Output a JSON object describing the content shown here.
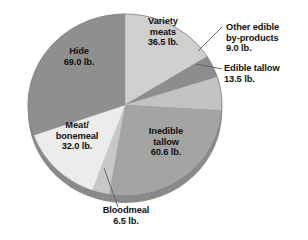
{
  "chart_data": {
    "type": "pie",
    "title": "",
    "subtitle": "",
    "unit": "lb.",
    "total": 227.1,
    "categories": [
      "Variety meats",
      "Other edible by-products",
      "Edible tallow",
      "Inedible tallow",
      "Bloodmeal",
      "Meat/bonemeal",
      "Hide"
    ],
    "values": [
      36.5,
      9.0,
      13.5,
      60.6,
      6.5,
      32.0,
      69.0
    ],
    "slices": [
      {
        "name": "Variety meats",
        "label": "Variety\nmeats\n36.5 lb.",
        "value": 36.5,
        "value_text": "36.5 lb.",
        "color": "#d0d0cf",
        "label_placement": "inside",
        "start_angle": 0.0,
        "sweep_angle": 57.9
      },
      {
        "name": "Other edible by-products",
        "label": "Other edible\nby-products\n9.0 lb.",
        "value": 9.0,
        "value_text": "9.0 lb.",
        "color": "#8d8d8c",
        "label_placement": "callout-right",
        "start_angle": 57.9,
        "sweep_angle": 14.3
      },
      {
        "name": "Edible tallow",
        "label": "Edible tallow\n13.5 lb.",
        "value": 13.5,
        "value_text": "13.5 lb.",
        "color": "#c3c3c2",
        "label_placement": "callout-right",
        "start_angle": 72.2,
        "sweep_angle": 21.4
      },
      {
        "name": "Inedible tallow",
        "label": "Inedible\ntallow\n60.6 lb.",
        "value": 60.6,
        "value_text": "60.6 lb.",
        "color": "#a4a4a3",
        "label_placement": "inside",
        "start_angle": 93.6,
        "sweep_angle": 96.1
      },
      {
        "name": "Bloodmeal",
        "label": "Bloodmeal\n6.5 lb.",
        "value": 6.5,
        "value_text": "6.5 lb.",
        "color": "#c8c8c7",
        "label_placement": "callout-bottom",
        "start_angle": 189.7,
        "sweep_angle": 10.3
      },
      {
        "name": "Meat/bonemeal",
        "label": "Meat/\nbonemeal\n32.0 lb.",
        "value": 32.0,
        "value_text": "32.0 lb.",
        "color": "#ececeb",
        "label_placement": "inside",
        "start_angle": 200.0,
        "sweep_angle": 50.7
      },
      {
        "name": "Hide",
        "label": "Hide\n69.0 lb.",
        "value": 69.0,
        "value_text": "69.0 lb.",
        "color": "#8f8f8e",
        "label_placement": "inside",
        "start_angle": 250.7,
        "sweep_angle": 109.4
      }
    ],
    "legend": "none",
    "grid": false
  },
  "labels": {
    "variety_meats": "Variety\nmeats\n36.5 lb.",
    "hide": "Hide\n69.0 lb.",
    "meat_bonemeal": "Meat/\nbonemeal\n32.0 lb.",
    "inedible_tallow": "Inedible\ntallow\n60.6 lb.",
    "other_edible_byproducts": "Other edible\nby-products\n9.0 lb.",
    "edible_tallow": "Edible tallow\n13.5 lb.",
    "bloodmeal": "Bloodmeal\n6.5 lb.",
    "cropped_fragment": "ble"
  },
  "colors": {
    "variety_meats": "#d0d0cf",
    "other_edible_byproducts": "#8d8d8c",
    "edible_tallow": "#c3c3c2",
    "inedible_tallow": "#a4a4a3",
    "bloodmeal": "#c8c8c7",
    "meat_bonemeal": "#ececeb",
    "hide": "#8f8f8e",
    "rim": "#909090",
    "background": "#ffffff",
    "text": "#111111",
    "leader_line": "#666666"
  }
}
